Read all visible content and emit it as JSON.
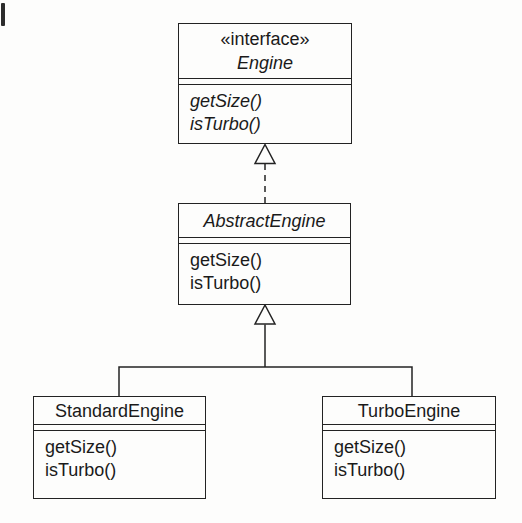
{
  "diagram": {
    "type": "uml-class-diagram",
    "background_color": "#fdfdfc",
    "line_color": "#232323"
  },
  "classes": {
    "engine": {
      "stereotype": "«interface»",
      "name": "Engine",
      "name_style": "italic",
      "methods": [
        "getSize()",
        "isTurbo()"
      ],
      "methods_style": "italic"
    },
    "abstract_engine": {
      "name": "AbstractEngine",
      "name_style": "italic",
      "methods": [
        "getSize()",
        "isTurbo()"
      ],
      "methods_style": "regular"
    },
    "standard_engine": {
      "name": "StandardEngine",
      "name_style": "regular",
      "methods": [
        "getSize()",
        "isTurbo()"
      ],
      "methods_style": "regular"
    },
    "turbo_engine": {
      "name": "TurboEngine",
      "name_style": "regular",
      "methods": [
        "getSize()",
        "isTurbo()"
      ],
      "methods_style": "regular"
    }
  },
  "relationships": [
    {
      "type": "realization",
      "from": "AbstractEngine",
      "to": "Engine",
      "line": "dashed",
      "arrowhead": "hollow-triangle"
    },
    {
      "type": "generalization",
      "from": "StandardEngine",
      "to": "AbstractEngine",
      "line": "solid",
      "arrowhead": "hollow-triangle"
    },
    {
      "type": "generalization",
      "from": "TurboEngine",
      "to": "AbstractEngine",
      "line": "solid",
      "arrowhead": "hollow-triangle"
    }
  ]
}
